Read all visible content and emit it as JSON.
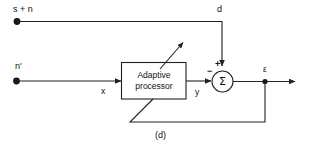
{
  "figure": {
    "caption": "(d)",
    "kind": "block-diagram",
    "line_color": "#222222",
    "text_color": "#111111",
    "background": "#ffffff"
  },
  "inputs": {
    "primary": {
      "label": "s + n",
      "terminal": "filled-dot",
      "path_label": "d"
    },
    "reference": {
      "label": "n'",
      "terminal": "filled-dot",
      "path_label": "x"
    }
  },
  "blocks": {
    "adaptive_processor": {
      "line1": "Adaptive",
      "line2": "processor",
      "shape": "rectangle",
      "adjust_arrow": "diagonal-adaptation-arrow"
    },
    "summing_junction": {
      "symbol": "Σ",
      "shape": "circle",
      "plus_sign": "+",
      "minus_sign": "−"
    }
  },
  "signals": {
    "d": "d",
    "x": "x",
    "y": "y",
    "error": "ε"
  },
  "feedback": {
    "name": "error-feedback-path",
    "from": "error-node",
    "to": "adaptive-processor"
  }
}
